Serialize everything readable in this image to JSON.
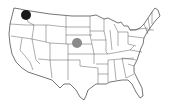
{
  "map": {
    "region": "United States (contiguous)",
    "style": "state outlines, black on white"
  },
  "markers": [
    {
      "id": "marker-washington",
      "location": "Washington",
      "x": 26,
      "y": 15,
      "r": 5,
      "color": "#1a1a1a"
    },
    {
      "id": "marker-nebraska",
      "location": "Nebraska / Kansas border",
      "x": 77,
      "y": 43,
      "r": 5,
      "color": "#8a8a8a"
    }
  ]
}
